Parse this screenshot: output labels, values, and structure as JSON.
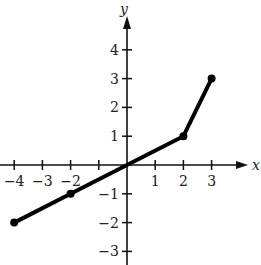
{
  "chart_data": {
    "type": "line",
    "title": "",
    "xlabel": "x",
    "ylabel": "y",
    "xlim": [
      -4.5,
      4
    ],
    "ylim": [
      -3.4,
      4.8
    ],
    "grid": false,
    "legend": null,
    "x_ticks": [
      -4,
      -3,
      -2,
      -1,
      1,
      2,
      3
    ],
    "x_tick_labels": [
      "−4",
      "−3",
      "−2",
      "",
      "1",
      "2",
      "3"
    ],
    "y_ticks": [
      4,
      3,
      2,
      1,
      -1,
      -2,
      -3
    ],
    "y_tick_labels": [
      "4",
      "3",
      "2",
      "1",
      "−1",
      "−2",
      "−3"
    ],
    "series": [
      {
        "name": "piecewise linear function",
        "color": "#000000",
        "points": [
          {
            "x": -4,
            "y": -2
          },
          {
            "x": -2,
            "y": -1
          },
          {
            "x": 0,
            "y": 0
          },
          {
            "x": 2,
            "y": 1
          },
          {
            "x": 3,
            "y": 3
          }
        ],
        "markers": [
          {
            "x": -4,
            "y": -2
          },
          {
            "x": -2,
            "y": -1
          },
          {
            "x": 2,
            "y": 1
          },
          {
            "x": 3,
            "y": 3
          }
        ]
      }
    ]
  },
  "layout": {
    "origin_px": [
      127,
      165
    ],
    "unit_x_px": 28.2,
    "unit_y_px": 28.8
  }
}
